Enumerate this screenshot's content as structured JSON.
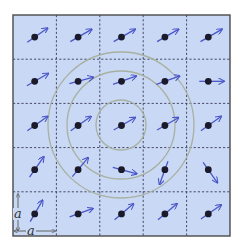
{
  "figure": {
    "lattice_label_x": "a",
    "lattice_label_y": "a",
    "rows": 5,
    "cols": 5,
    "colors": {
      "background": "#c9d9f5",
      "frame": "#4a4a4a",
      "grid": "#3a3a55",
      "dot": "#1a1a2a",
      "arrow": "#4a55c8",
      "circle": "#a8b0a0"
    },
    "box": {
      "x": 13,
      "y": 15,
      "w": 217,
      "h": 221
    },
    "circles": [
      {
        "name": "inner",
        "cx": 121,
        "cy": 125,
        "r": 25
      },
      {
        "name": "middle",
        "cx": 121,
        "cy": 125,
        "r": 54
      },
      {
        "name": "outer",
        "cx": 121,
        "cy": 125,
        "r": 73
      }
    ],
    "spins": [
      [
        {
          "angle": -35
        },
        {
          "angle": -30
        },
        {
          "angle": -30
        },
        {
          "angle": -30
        },
        {
          "angle": -30
        }
      ],
      [
        {
          "angle": -30
        },
        {
          "angle": -15
        },
        {
          "angle": -20
        },
        {
          "angle": -20
        },
        {
          "angle": 0
        }
      ],
      [
        {
          "angle": -35
        },
        {
          "angle": -35
        },
        {
          "angle": -30
        },
        {
          "angle": -30
        },
        {
          "angle": -35
        }
      ],
      [
        {
          "angle": -55
        },
        {
          "angle": -50
        },
        {
          "angle": 15
        },
        {
          "angle": 110
        },
        {
          "angle": 55
        }
      ],
      [
        {
          "angle": -60
        },
        {
          "angle": -20
        },
        {
          "angle": -40
        },
        {
          "angle": -40
        },
        {
          "angle": -35
        }
      ]
    ]
  }
}
